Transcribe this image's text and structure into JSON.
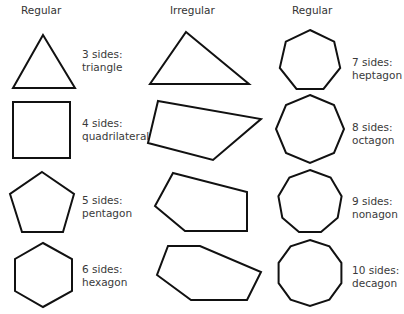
{
  "columns": [
    {
      "heading": "Regular"
    },
    {
      "heading": "Irregular"
    },
    {
      "heading": "Regular"
    }
  ],
  "shapes": [
    {
      "sides": "3 sides:",
      "name": "triangle"
    },
    {
      "sides": "4 sides:",
      "name": "quadrilateral"
    },
    {
      "sides": "5 sides:",
      "name": "pentagon"
    },
    {
      "sides": "6 sides:",
      "name": "hexagon"
    },
    {
      "sides": "7 sides:",
      "name": "heptagon"
    },
    {
      "sides": "8 sides:",
      "name": "octagon"
    },
    {
      "sides": "9 sides:",
      "name": "nonagon"
    },
    {
      "sides": "10 sides:",
      "name": "decagon"
    }
  ],
  "colors": {
    "stroke": "#111111",
    "text": "#3a3a3a",
    "background": "#ffffff"
  }
}
